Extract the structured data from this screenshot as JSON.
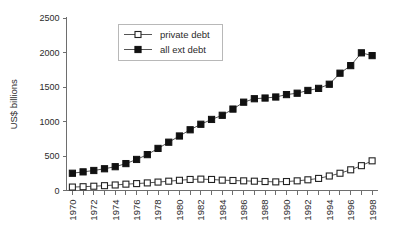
{
  "chart_data": {
    "type": "line",
    "title": "",
    "xlabel": "",
    "ylabel": "US$ billions",
    "ylim": [
      0,
      2500
    ],
    "yticks": [
      0,
      500,
      1000,
      1500,
      2000,
      2500
    ],
    "ytick_labels": [
      "0",
      "500",
      "1000",
      "1500",
      "2000",
      "2500"
    ],
    "grid": false,
    "legend_position": "top-center",
    "x": [
      1970,
      1971,
      1972,
      1973,
      1974,
      1975,
      1976,
      1977,
      1978,
      1979,
      1980,
      1981,
      1982,
      1983,
      1984,
      1985,
      1986,
      1987,
      1988,
      1989,
      1990,
      1991,
      1992,
      1993,
      1994,
      1995,
      1996,
      1997,
      1998
    ],
    "xtick_labels": [
      "1970",
      "",
      "1972",
      "",
      "1974",
      "",
      "1976",
      "",
      "1978",
      "",
      "1980",
      "",
      "1982",
      "",
      "1984",
      "",
      "1986",
      "",
      "1988",
      "",
      "1990",
      "",
      "1992",
      "",
      "1994",
      "",
      "1996",
      "",
      "1998"
    ],
    "xtick_labels_shown": [
      "1970",
      "1972",
      "1974",
      "1976",
      "1978",
      "1980",
      "1982",
      "1984",
      "1986",
      "1988",
      "1990",
      "1992",
      "1994",
      "1996",
      "1998"
    ],
    "series": [
      {
        "name": "private debt",
        "marker": "open-square",
        "color": "#222222",
        "values": [
          50,
          55,
          62,
          70,
          80,
          92,
          100,
          110,
          122,
          135,
          148,
          160,
          165,
          160,
          150,
          145,
          140,
          135,
          130,
          125,
          130,
          140,
          155,
          175,
          210,
          250,
          300,
          360,
          430
        ]
      },
      {
        "name": "all ext debt",
        "marker": "filled-square",
        "color": "#111111",
        "values": [
          250,
          270,
          290,
          315,
          345,
          390,
          450,
          520,
          610,
          700,
          790,
          880,
          960,
          1030,
          1090,
          1180,
          1280,
          1330,
          1340,
          1355,
          1390,
          1410,
          1450,
          1480,
          1540,
          1700,
          1810,
          1995,
          1955
        ]
      }
    ]
  },
  "legend": {
    "items": [
      {
        "label": "private debt",
        "marker": "open-square"
      },
      {
        "label": "all ext debt",
        "marker": "filled-square"
      }
    ]
  },
  "axes": {
    "y_title": "US$ billions"
  }
}
